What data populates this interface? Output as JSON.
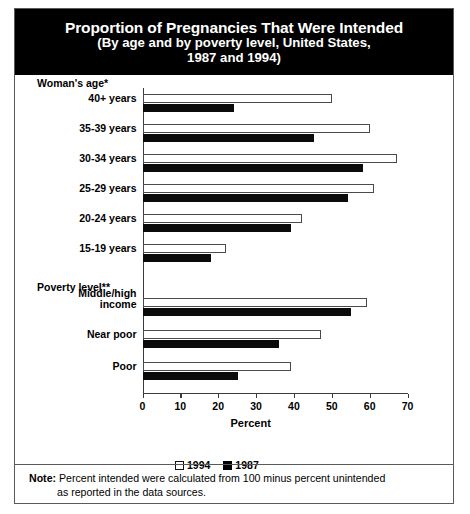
{
  "title": {
    "line1": "Proportion of Pregnancies That Were Intended",
    "line2": "(By age and by poverty level, United States,",
    "line3": "1987 and 1994)"
  },
  "groups": {
    "age_header": "Woman's age*",
    "poverty_header": "Poverty level**"
  },
  "axis": {
    "xlabel": "Percent",
    "ticks": [
      "0",
      "10",
      "20",
      "30",
      "40",
      "50",
      "60",
      "70"
    ]
  },
  "legend": [
    {
      "label": "1994",
      "swatch": "white-square"
    },
    {
      "label": "1987",
      "swatch": "black-square"
    }
  ],
  "note": {
    "prefix": "Note:",
    "line1": " Percent intended were calculated from 100 minus percent unintended",
    "line2": "as reported in the data sources."
  },
  "chart_data": {
    "type": "bar",
    "orientation": "horizontal",
    "title": "Proportion of Pregnancies That Were Intended (By age and by poverty level, United States, 1987 and 1994)",
    "xlabel": "Percent",
    "ylabel": "",
    "xlim": [
      0,
      70
    ],
    "xticks": [
      0,
      10,
      20,
      30,
      40,
      50,
      60,
      70
    ],
    "grid": false,
    "legend_position": "bottom-center",
    "categories": [
      "40+ years",
      "35-39 years",
      "30-34 years",
      "25-29 years",
      "20-24 years",
      "15-19 years",
      "Middle/high income",
      "Near poor",
      "Poor"
    ],
    "category_groups": [
      {
        "header": "Woman's age*",
        "categories": [
          "40+ years",
          "35-39 years",
          "30-34 years",
          "25-29 years",
          "20-24 years",
          "15-19 years"
        ]
      },
      {
        "header": "Poverty level**",
        "categories": [
          "Middle/high income",
          "Near poor",
          "Poor"
        ]
      }
    ],
    "series": [
      {
        "name": "1994",
        "color": "#ffffff",
        "values": [
          50,
          60,
          67,
          61,
          42,
          22,
          59,
          47,
          39
        ]
      },
      {
        "name": "1987",
        "color": "#000000",
        "values": [
          24,
          45,
          58,
          54,
          39,
          18,
          55,
          36,
          25
        ]
      }
    ]
  }
}
